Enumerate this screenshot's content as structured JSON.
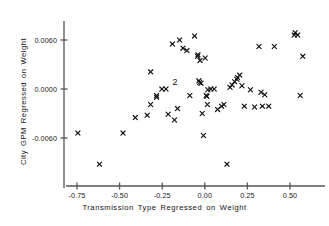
{
  "chart_data": {
    "type": "scatter",
    "title": "",
    "xlabel": "Transmission Type Regressed on Weight",
    "ylabel": "City GPM Regressed on Weight",
    "xlim": [
      -0.82,
      0.64
    ],
    "ylim": [
      -0.0105,
      0.008
    ],
    "xticks": [
      -0.75,
      -0.5,
      -0.25,
      0.0,
      0.25,
      0.5
    ],
    "xticklabels": [
      "-0.75",
      "-0.50",
      "-0.25",
      "0.00",
      "0.25",
      "0.50"
    ],
    "yticks": [
      0.006,
      0.0,
      -0.006
    ],
    "yticklabels": [
      "0.0060",
      "0.0000",
      "-0.0060"
    ],
    "grid": false,
    "legend": null,
    "marker": "x",
    "marker_color": "#111111",
    "axis_color": "#555555",
    "series": [
      {
        "name": "observations",
        "x": [
          -0.745,
          -0.618,
          -0.48,
          -0.408,
          -0.338,
          -0.318,
          -0.318,
          -0.283,
          -0.283,
          -0.252,
          -0.228,
          -0.215,
          -0.19,
          -0.178,
          -0.16,
          -0.148,
          -0.128,
          -0.105,
          -0.088,
          -0.06,
          -0.042,
          -0.04,
          -0.035,
          -0.03,
          -0.028,
          -0.022,
          -0.015,
          -0.008,
          0.002,
          0.008,
          0.012,
          0.015,
          0.018,
          0.035,
          0.055,
          0.075,
          0.098,
          0.112,
          0.13,
          0.148,
          0.16,
          0.175,
          0.188,
          0.192,
          0.205,
          0.218,
          0.232,
          0.268,
          0.292,
          0.318,
          0.33,
          0.338,
          0.352,
          0.375,
          0.408,
          0.525,
          0.53,
          0.545,
          0.56,
          0.575
        ],
        "y": [
          -0.0054,
          -0.0092,
          -0.0054,
          -0.0035,
          -0.0032,
          0.0021,
          -0.0019,
          -0.001,
          -0.0008,
          0.0,
          0.0,
          -0.0031,
          0.0055,
          -0.0038,
          -0.0024,
          0.006,
          0.005,
          0.0047,
          -0.0008,
          0.0065,
          0.004,
          0.0042,
          0.001,
          0.0008,
          0.0035,
          0.0007,
          -0.003,
          -0.0057,
          0.0038,
          -0.0008,
          -0.0009,
          -0.0019,
          -0.0001,
          0.0,
          0.0,
          -0.0025,
          -0.0021,
          -0.0019,
          -0.0092,
          0.0002,
          0.0005,
          0.0009,
          0.0012,
          0.0014,
          0.0017,
          0.0004,
          -0.0021,
          -0.0001,
          -0.0022,
          0.0052,
          -0.0004,
          -0.0021,
          -0.0007,
          -0.0021,
          0.0052,
          0.0066,
          0.0069,
          0.0066,
          -0.0008,
          0.004
        ]
      }
    ],
    "annotations": [
      {
        "text": "2",
        "x": -0.175,
        "y": 0.0008,
        "meaning": "two-overlapping-points-count"
      }
    ]
  }
}
